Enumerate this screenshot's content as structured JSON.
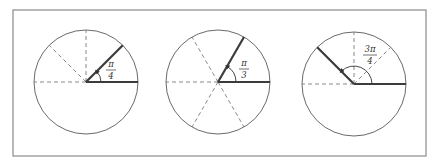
{
  "figure": {
    "panels": [
      {
        "id": "pi-over-4",
        "label": {
          "numerator": "π",
          "denominator": "4"
        },
        "angle_radians": "π/4",
        "angle_degrees": 45,
        "divisions": "quarters (dashed lines at 90°, 135°, 180°)"
      },
      {
        "id": "pi-over-3",
        "label": {
          "numerator": "π",
          "denominator": "3"
        },
        "angle_radians": "π/3",
        "angle_degrees": 60,
        "divisions": "sixths (dashed lines at 120°, 180°, 240°, 300°)"
      },
      {
        "id": "3pi-over-4",
        "label": {
          "numerator": "3π",
          "denominator": "4"
        },
        "angle_radians": "3π/4",
        "angle_degrees": 135,
        "divisions": "eighths (dashed lines at 45°, 90°, 180°)"
      }
    ]
  }
}
